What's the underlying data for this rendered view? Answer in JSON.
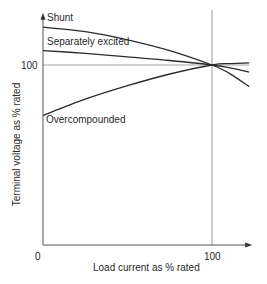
{
  "chart_data": {
    "type": "line",
    "title": "",
    "xlabel": "Load current as % rated",
    "ylabel": "Terminal voltage as % rated",
    "xlim": [
      0,
      122
    ],
    "ylim": [
      0,
      129
    ],
    "x_ticks": [
      {
        "value": 0,
        "label": "0"
      },
      {
        "value": 100,
        "label": "100"
      }
    ],
    "y_ticks": [
      {
        "value": 100,
        "label": "100"
      }
    ],
    "reference_lines": [
      {
        "orientation": "horizontal",
        "value": 100
      },
      {
        "orientation": "vertical",
        "value": 100
      }
    ],
    "grid": false,
    "legend": "inline labels",
    "series": [
      {
        "name": "Shunt",
        "x": [
          0,
          25,
          50,
          75,
          100,
          110,
          122
        ],
        "values": [
          121,
          118.5,
          114,
          108,
          100,
          95.5,
          88
        ]
      },
      {
        "name": "Separately excited",
        "x": [
          0,
          25,
          50,
          75,
          100,
          110,
          122
        ],
        "values": [
          108,
          106.5,
          104.5,
          102.5,
          100,
          98.5,
          96
        ]
      },
      {
        "name": "Overcompounded",
        "x": [
          0,
          25,
          50,
          75,
          100,
          110,
          122
        ],
        "values": [
          72,
          81,
          88.5,
          95,
          100,
          100.8,
          101.2
        ]
      }
    ],
    "annotations": [
      {
        "text": "Shunt",
        "series": "Shunt"
      },
      {
        "text": "Separately excited",
        "series": "Separately excited"
      },
      {
        "text": "Overcompounded",
        "series": "Overcompounded"
      }
    ]
  }
}
